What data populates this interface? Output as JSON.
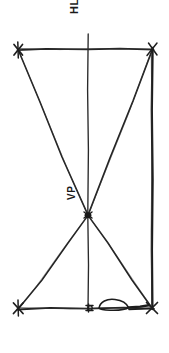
{
  "drawing": {
    "kind": "perspective-construction-sketch",
    "medium": "hand-drawn pencil line drawing",
    "background_color": "#ffffff",
    "ink_color": "#1f1f1f",
    "width": 169,
    "height": 353
  },
  "labels": {
    "horizon_line": "HL",
    "vanishing_point": "VP"
  },
  "geometry": {
    "top_left": {
      "x": 18,
      "y": 49
    },
    "top_right": {
      "x": 152,
      "y": 49
    },
    "bottom_left": {
      "x": 18,
      "y": 308
    },
    "bottom_right": {
      "x": 152,
      "y": 308
    },
    "vanishing_point": {
      "x": 88,
      "y": 215
    },
    "center_vertical_x": 88,
    "horizon_line_y": 49,
    "ground_line_y": 308
  },
  "elements": {
    "top_horizontal_label": "top horizontal line",
    "bottom_horizontal_label": "bottom horizontal line",
    "center_vertical_label": "central vertical axis",
    "right_vertical_label": "right vertical edge",
    "diagonal_tl_vp_label": "diagonal top-left to vanishing point",
    "diagonal_tr_vp_label": "diagonal top-right to vanishing point",
    "diagonal_vp_bl_label": "diagonal vanishing point to bottom-left",
    "diagonal_vp_br_label": "diagonal vanishing point to bottom-right",
    "corner_mark_label": "corner cross mark",
    "vp_node_label": "vanishing point node",
    "ground_figure_label": "small sketched figure on ground line"
  }
}
